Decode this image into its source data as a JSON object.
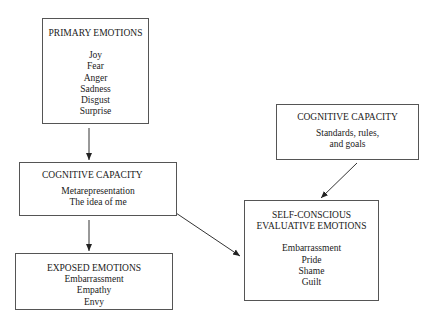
{
  "diagram": {
    "primary": {
      "title": "PRIMARY EMOTIONS",
      "items": [
        "Joy",
        "Fear",
        "Anger",
        "Sadness",
        "Disgust",
        "Surprise"
      ]
    },
    "cognitive_left": {
      "title": "COGNITIVE CAPACITY",
      "items": [
        "Metarepresentation",
        "The idea of me"
      ]
    },
    "exposed": {
      "title": "EXPOSED EMOTIONS",
      "items": [
        "Embarrassment",
        "Empathy",
        "Envy"
      ]
    },
    "cognitive_right": {
      "title": "COGNITIVE CAPACITY",
      "items": [
        "Standards, rules,",
        "and goals"
      ]
    },
    "self_conscious": {
      "title_line1": "SELF-CONSCIOUS",
      "title_line2": "EVALUATIVE EMOTIONS",
      "items": [
        "Embarrassment",
        "Pride",
        "Shame",
        "Guilt"
      ]
    },
    "edges": [
      {
        "from": "PRIMARY EMOTIONS",
        "to": "COGNITIVE CAPACITY (Metarepresentation)"
      },
      {
        "from": "COGNITIVE CAPACITY (Metarepresentation)",
        "to": "EXPOSED EMOTIONS"
      },
      {
        "from": "COGNITIVE CAPACITY (Metarepresentation)",
        "to": "SELF-CONSCIOUS EVALUATIVE EMOTIONS"
      },
      {
        "from": "COGNITIVE CAPACITY (Standards, rules, and goals)",
        "to": "SELF-CONSCIOUS EVALUATIVE EMOTIONS"
      }
    ],
    "colors": {
      "line": "#333333",
      "border": "#555555",
      "text": "#1a1a1a",
      "background": "#ffffff"
    }
  }
}
